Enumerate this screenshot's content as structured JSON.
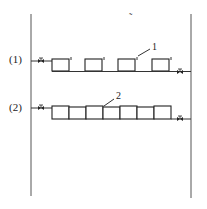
{
  "diagram": {
    "type": "piping-schematic",
    "rows": [
      {
        "label": "(1)",
        "arrangement": "spaced",
        "unit_count": 4,
        "callout": "1"
      },
      {
        "label": "(2)",
        "arrangement": "contiguous",
        "unit_count": 7,
        "callout": "2"
      }
    ],
    "stray_mark": "˜",
    "icons": {
      "valve": "valve-icon"
    },
    "colors": {
      "line": "#333333",
      "background": "#ffffff"
    }
  }
}
